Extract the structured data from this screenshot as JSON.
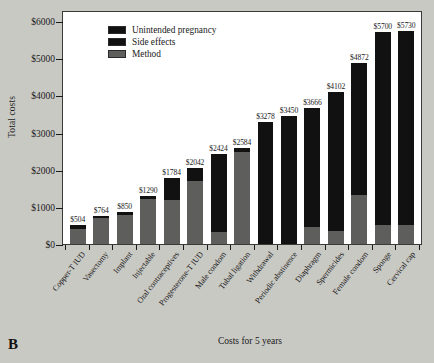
{
  "panel": {
    "label": "B"
  },
  "legend": {
    "position": "top-left-inside",
    "items": [
      {
        "label": "Unintended pregnancy",
        "color": "#111111",
        "key": "unintended_pregnancy"
      },
      {
        "label": "Side effects",
        "color": "#111111",
        "key": "side_effects"
      },
      {
        "label": "Method",
        "color": "#5e5e5c",
        "key": "method"
      }
    ]
  },
  "chart_data": {
    "type": "bar",
    "stacked": true,
    "title": "",
    "xlabel": "Costs for 5 years",
    "ylabel": "Total costs",
    "ylim": [
      0,
      6300
    ],
    "yticks": [
      0,
      1000,
      2000,
      3000,
      4000,
      5000,
      6000
    ],
    "ytick_labels": [
      "$0",
      "$1000",
      "$2000",
      "$3000",
      "$4000",
      "$5000",
      "$6000"
    ],
    "grid": false,
    "legend_position": "upper left",
    "categories": [
      "Copper-T IUD",
      "Vasectomy",
      "Implant",
      "Injectable",
      "Oral contraceptives",
      "Progesterone-T IUD",
      "Male condom",
      "Tubal ligation",
      "Withdrawal",
      "Periodic abstinence",
      "Diaphragm",
      "Spermicides",
      "Female condom",
      "Sponge",
      "Cervical cap"
    ],
    "totals": [
      504,
      764,
      850,
      1290,
      1784,
      2042,
      2424,
      2584,
      3278,
      3450,
      3666,
      4102,
      4872,
      5700,
      5730
    ],
    "total_labels": [
      "$504",
      "$764",
      "$850",
      "$1290",
      "$1784",
      "$2042",
      "$2424",
      "$2584",
      "$3278",
      "$3450",
      "$3666",
      "$4102",
      "$4872",
      "$5700",
      "$5730"
    ],
    "series": [
      {
        "name": "Method",
        "color": "#5e5e5c",
        "values": [
          400,
          700,
          790,
          1220,
          1180,
          1690,
          330,
          2480,
          0,
          0,
          460,
          350,
          1320,
          500,
          520
        ]
      },
      {
        "name": "Side effects",
        "color": "#111111",
        "values": [
          104,
          64,
          60,
          70,
          604,
          352,
          2094,
          104,
          3278,
          3450,
          3206,
          3752,
          3552,
          5200,
          5210
        ]
      },
      {
        "name": "Unintended pregnancy",
        "color": "#111111",
        "values": [
          0,
          0,
          0,
          0,
          0,
          0,
          0,
          0,
          0,
          0,
          0,
          0,
          0,
          0,
          0
        ]
      }
    ]
  }
}
